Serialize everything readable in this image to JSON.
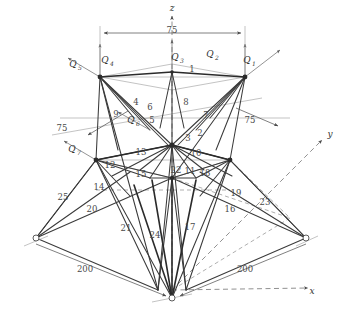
{
  "figure": {
    "type": "engineering-diagram",
    "background_color": "#ffffff",
    "line_color": "#3a3a3a",
    "guide_color": "#9a9a9a"
  },
  "axes": [
    {
      "name": "z-axis",
      "label": "z",
      "direction": "up",
      "x": 172,
      "y": 11
    },
    {
      "name": "y-axis",
      "label": "y",
      "direction": "right",
      "x": 330,
      "y": 137
    },
    {
      "name": "x-axis",
      "label": "x",
      "direction": "down-right",
      "x": 312,
      "y": 294
    }
  ],
  "loads": [
    {
      "name": "Q4",
      "base": "Q",
      "sub": "4",
      "x": 105,
      "y": 63
    },
    {
      "name": "Q3",
      "base": "Q",
      "sub": "3",
      "x": 175,
      "y": 60
    },
    {
      "name": "Q2",
      "base": "Q",
      "sub": "2",
      "x": 210,
      "y": 57
    },
    {
      "name": "Q1",
      "base": "Q",
      "sub": "1",
      "x": 247,
      "y": 63
    },
    {
      "name": "Q5",
      "base": "Q",
      "sub": "5",
      "x": 73,
      "y": 67
    },
    {
      "name": "Q6",
      "base": "Q",
      "sub": "6",
      "x": 131,
      "y": 123
    },
    {
      "name": "Q7",
      "base": "Q",
      "sub": "7",
      "x": 72,
      "y": 152
    }
  ],
  "dimensions": [
    {
      "name": "dim-top-75",
      "value": "75",
      "x": 172,
      "y": 33
    },
    {
      "name": "dim-left-75",
      "value": "75",
      "x": 62,
      "y": 131
    },
    {
      "name": "dim-right-75",
      "value": "75",
      "x": 250,
      "y": 123
    },
    {
      "name": "dim-left-200",
      "value": "200",
      "x": 85,
      "y": 272
    },
    {
      "name": "dim-right-200",
      "value": "200",
      "x": 245,
      "y": 272
    }
  ],
  "member_labels": [
    {
      "name": "member-1",
      "value": "1",
      "x": 192,
      "y": 72
    },
    {
      "name": "member-2",
      "value": "2",
      "x": 200,
      "y": 136
    },
    {
      "name": "member-3",
      "value": "3",
      "x": 188,
      "y": 141
    },
    {
      "name": "member-4",
      "value": "4",
      "x": 136,
      "y": 105
    },
    {
      "name": "member-5",
      "value": "5",
      "x": 152,
      "y": 123
    },
    {
      "name": "member-6",
      "value": "6",
      "x": 150,
      "y": 110
    },
    {
      "name": "member-7",
      "value": "7",
      "x": 206,
      "y": 118
    },
    {
      "name": "member-8",
      "value": "8",
      "x": 186,
      "y": 105
    },
    {
      "name": "member-9",
      "value": "9",
      "x": 116,
      "y": 117
    },
    {
      "name": "member-10",
      "value": "10",
      "x": 196,
      "y": 156
    },
    {
      "name": "member-11",
      "value": "11",
      "x": 190,
      "y": 174
    },
    {
      "name": "member-12",
      "value": "12",
      "x": 110,
      "y": 168
    },
    {
      "name": "member-13",
      "value": "13",
      "x": 141,
      "y": 155
    },
    {
      "name": "member-14",
      "value": "14",
      "x": 99,
      "y": 190
    },
    {
      "name": "member-15",
      "value": "15",
      "x": 141,
      "y": 177
    },
    {
      "name": "member-16",
      "value": "16",
      "x": 230,
      "y": 212
    },
    {
      "name": "member-17",
      "value": "17",
      "x": 190,
      "y": 230
    },
    {
      "name": "member-18",
      "value": "18",
      "x": 205,
      "y": 176
    },
    {
      "name": "member-19",
      "value": "19",
      "x": 236,
      "y": 196
    },
    {
      "name": "member-20",
      "value": "20",
      "x": 92,
      "y": 212
    },
    {
      "name": "member-21",
      "value": "21",
      "x": 126,
      "y": 231
    },
    {
      "name": "member-22",
      "value": "22",
      "x": 176,
      "y": 173
    },
    {
      "name": "member-23",
      "value": "23",
      "x": 265,
      "y": 205
    },
    {
      "name": "member-24",
      "value": "24",
      "x": 155,
      "y": 238
    },
    {
      "name": "member-25",
      "value": "25",
      "x": 63,
      "y": 200
    }
  ]
}
